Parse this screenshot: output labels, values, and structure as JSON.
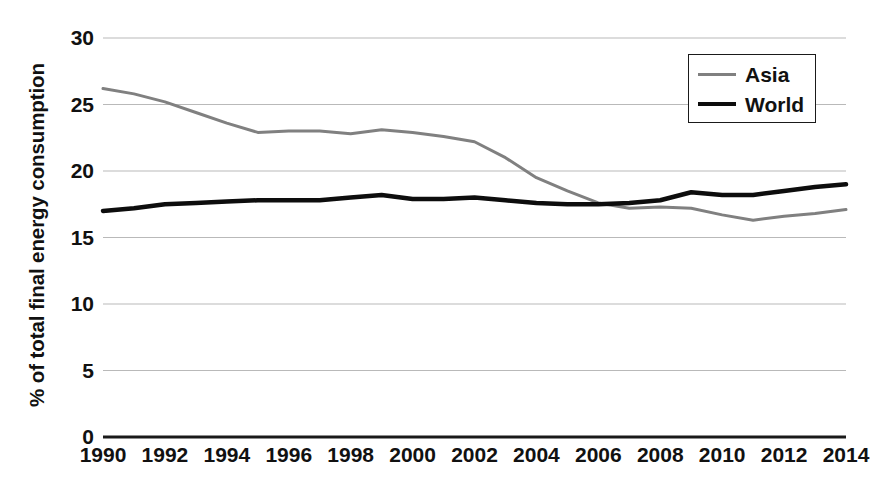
{
  "chart_data": {
    "type": "line",
    "title": "",
    "xlabel": "",
    "ylabel": "% of total final energy consumption",
    "xlim": [
      1990,
      2014
    ],
    "ylim": [
      0,
      30
    ],
    "ytick_labels": [
      "0",
      "5",
      "10",
      "15",
      "20",
      "25",
      "30"
    ],
    "ytick_values": [
      0,
      5,
      10,
      15,
      20,
      25,
      30
    ],
    "xtick_labels": [
      "1990",
      "1992",
      "1994",
      "1996",
      "1998",
      "2000",
      "2002",
      "2004",
      "2006",
      "2008",
      "2010",
      "2012",
      "2014"
    ],
    "xtick_values": [
      1990,
      1992,
      1994,
      1996,
      1998,
      2000,
      2002,
      2004,
      2006,
      2008,
      2010,
      2012,
      2014
    ],
    "grid": true,
    "grid_axis": "y",
    "legend_position": "upper right",
    "x": [
      1990,
      1991,
      1992,
      1993,
      1994,
      1995,
      1996,
      1997,
      1998,
      1999,
      2000,
      2001,
      2002,
      2003,
      2004,
      2005,
      2006,
      2007,
      2008,
      2009,
      2010,
      2011,
      2012,
      2013,
      2014
    ],
    "series": [
      {
        "name": "Asia",
        "color": "#808080",
        "line_width": 3,
        "values": [
          26.2,
          25.8,
          25.2,
          24.4,
          23.6,
          22.9,
          23.0,
          23.0,
          22.8,
          23.1,
          22.9,
          22.6,
          22.2,
          21.0,
          19.5,
          18.5,
          17.6,
          17.2,
          17.3,
          17.2,
          16.7,
          16.3,
          16.6,
          16.8,
          17.1
        ]
      },
      {
        "name": "World",
        "color": "#0d0d0d",
        "line_width": 4.5,
        "values": [
          17.0,
          17.2,
          17.5,
          17.6,
          17.7,
          17.8,
          17.8,
          17.8,
          18.0,
          18.2,
          17.9,
          17.9,
          18.0,
          17.8,
          17.6,
          17.5,
          17.5,
          17.6,
          17.8,
          18.4,
          18.2,
          18.2,
          18.5,
          18.8,
          19.0
        ]
      }
    ]
  },
  "legend": {
    "items": [
      {
        "label": "Asia"
      },
      {
        "label": "World"
      }
    ]
  }
}
